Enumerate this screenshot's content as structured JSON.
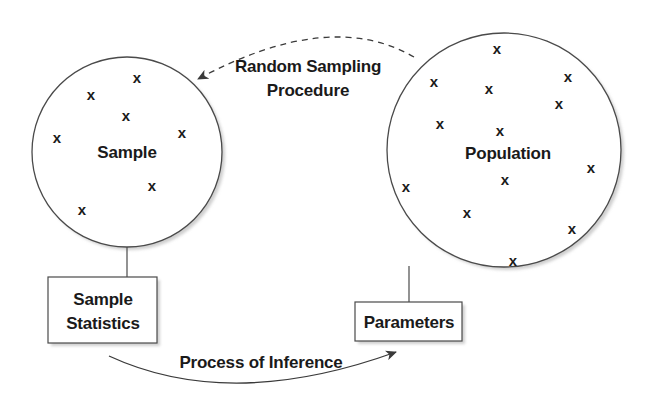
{
  "diagram": {
    "sample": {
      "label": "Sample",
      "points": [
        {
          "x": 137,
          "y": 78
        },
        {
          "x": 91,
          "y": 95
        },
        {
          "x": 126,
          "y": 116
        },
        {
          "x": 57,
          "y": 138
        },
        {
          "x": 182,
          "y": 133
        },
        {
          "x": 152,
          "y": 186
        },
        {
          "x": 82,
          "y": 210
        }
      ]
    },
    "population": {
      "label": "Population",
      "points": [
        {
          "x": 497,
          "y": 49
        },
        {
          "x": 434,
          "y": 82
        },
        {
          "x": 489,
          "y": 89
        },
        {
          "x": 568,
          "y": 77
        },
        {
          "x": 559,
          "y": 104
        },
        {
          "x": 440,
          "y": 124
        },
        {
          "x": 500,
          "y": 131
        },
        {
          "x": 591,
          "y": 168
        },
        {
          "x": 406,
          "y": 187
        },
        {
          "x": 505,
          "y": 180
        },
        {
          "x": 467,
          "y": 213
        },
        {
          "x": 572,
          "y": 229
        },
        {
          "x": 513,
          "y": 261
        }
      ]
    },
    "sample_statistics_box": {
      "line1": "Sample",
      "line2": "Statistics"
    },
    "parameters_box": {
      "label": "Parameters"
    },
    "sampling_arrow": {
      "line1": "Random Sampling",
      "line2": "Procedure",
      "style": "dashed"
    },
    "inference_arrow": {
      "label": "Process of Inference",
      "style": "solid"
    },
    "point_glyph": "x",
    "colors": {
      "stroke": "#4a4a4a",
      "text": "#1a1a1a",
      "shadow": "#c8c8c8"
    }
  }
}
